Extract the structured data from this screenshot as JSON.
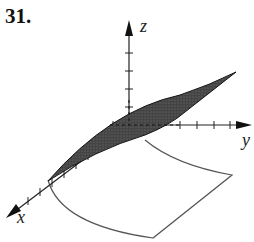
{
  "problem": {
    "number": "31."
  },
  "figure": {
    "type": "3d-surface-plot",
    "axes": {
      "x_label": "x",
      "y_label": "y",
      "z_label": "z"
    },
    "surface": {
      "fill": "#3c3c3c",
      "description": "shaded surface rising along y"
    },
    "projection_outline": {
      "stroke": "#555555",
      "description": "region in xy-plane"
    }
  }
}
